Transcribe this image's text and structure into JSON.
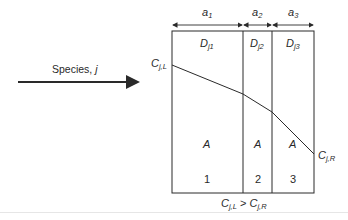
{
  "diagram": {
    "type": "multilayer-membrane-concentration-profile",
    "flow_label": {
      "text": "Species, ",
      "var": "j"
    },
    "widths": [
      {
        "base": "a",
        "sub": "1"
      },
      {
        "base": "a",
        "sub": "2"
      },
      {
        "base": "a",
        "sub": "3"
      }
    ],
    "diffusivities": [
      {
        "base": "D",
        "sub": "j1"
      },
      {
        "base": "D",
        "sub": "j2"
      },
      {
        "base": "D",
        "sub": "j3"
      }
    ],
    "areas": [
      "A",
      "A",
      "A"
    ],
    "layer_numbers": [
      "1",
      "2",
      "3"
    ],
    "left_concentration": {
      "base": "C",
      "sub": "j,L"
    },
    "right_concentration": {
      "base": "C",
      "sub": "j,R"
    },
    "condition": {
      "left": {
        "base": "C",
        "sub": "j,L"
      },
      "op": " > ",
      "right": {
        "base": "C",
        "sub": "j,R"
      }
    },
    "colors": {
      "line": "#2a2a2a",
      "background": "#ffffff"
    }
  }
}
